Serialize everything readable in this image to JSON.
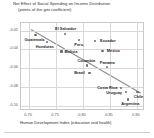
{
  "chart_data": {
    "type": "scatter",
    "title": "Net Effect of Social Spending on Income Distribution",
    "subtitle": "(points of the gini coefficient)",
    "xlabel": "Human Development Index (education and health)",
    "ylabel": "",
    "xlim": [
      0.685,
      0.915
    ],
    "ylim": [
      -0.105,
      -0.012
    ],
    "xticks": [
      "0.70",
      "0.75",
      "0.80",
      "0.85",
      "0.90"
    ],
    "xtick_values": [
      0.7,
      0.75,
      0.8,
      0.85,
      0.9
    ],
    "yticks": [
      "-0.02",
      "-0.04",
      "-0.06",
      "-0.08",
      "-0.10"
    ],
    "ytick_values": [
      -0.02,
      -0.04,
      -0.06,
      -0.08,
      -0.1
    ],
    "grid": true,
    "legend": "none",
    "points": [
      {
        "name": "Guatemala",
        "x": 0.712,
        "y": -0.0243,
        "label_dx": -1,
        "label_dy": 5.2
      },
      {
        "name": "Honduras",
        "x": 0.733,
        "y": -0.032,
        "label_dx": -2,
        "label_dy": 4.6
      },
      {
        "name": "El Salvador",
        "x": 0.766,
        "y": -0.0232,
        "label_dx": 1,
        "label_dy": -4.2
      },
      {
        "name": "Peru",
        "x": 0.792,
        "y": -0.03,
        "label_dx": 0,
        "label_dy": 4.8
      },
      {
        "name": "Ecuador",
        "x": 0.823,
        "y": -0.0312,
        "label_dx": 12.5,
        "label_dy": 0
      },
      {
        "name": "Bolivia",
        "x": 0.76,
        "y": -0.0422,
        "label_dx": 9.5,
        "label_dy": 0
      },
      {
        "name": "Mexico",
        "x": 0.836,
        "y": -0.0418,
        "label_dx": 11,
        "label_dy": 0
      },
      {
        "name": "Colombia",
        "x": 0.808,
        "y": -0.057,
        "label_dx": -1,
        "label_dy": -4.3
      },
      {
        "name": "Panama",
        "x": 0.845,
        "y": -0.0588,
        "label_dx": 0,
        "label_dy": -4.3
      },
      {
        "name": "Brazil",
        "x": 0.812,
        "y": -0.065,
        "label_dx": -10,
        "label_dy": 0
      },
      {
        "name": "Costa Rica",
        "x": 0.871,
        "y": -0.0808,
        "label_dx": -14,
        "label_dy": 0
      },
      {
        "name": "Uruguay",
        "x": 0.88,
        "y": -0.0852,
        "label_dx": -12,
        "label_dy": 1.2
      },
      {
        "name": "Chile",
        "x": 0.901,
        "y": -0.0845,
        "label_dx": 1,
        "label_dy": 5.0
      },
      {
        "name": "Argentina",
        "x": 0.884,
        "y": -0.0928,
        "label_dx": 2,
        "label_dy": 4.6
      }
    ],
    "trendline": {
      "x_start": 0.7035,
      "y_start": -0.0188,
      "x_end": 0.9075,
      "y_end": -0.0862,
      "color": "#8c8c8c"
    },
    "colors": {
      "marker": "#6b6b6b",
      "grid": "#d8d8d8",
      "frame": "#c8c8c8",
      "text": "#1f1f1f",
      "background": "#ffffff"
    }
  }
}
